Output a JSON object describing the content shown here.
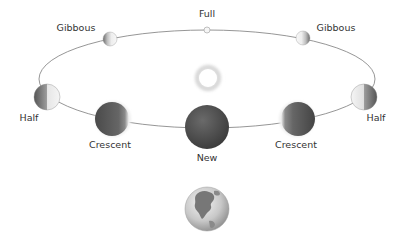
{
  "diagram": {
    "type": "moon-phases",
    "orbit": {
      "cx": 207,
      "cy": 79,
      "rx": 168,
      "ry": 49,
      "color": "#8a8a8a"
    },
    "sun": {
      "cx": 208,
      "cy": 78,
      "r": 12
    },
    "earth": {
      "cx": 207,
      "cy": 209,
      "r": 22
    },
    "phases": [
      {
        "id": "full",
        "label": "Full",
        "cx": 207,
        "cy": 30,
        "r": 3,
        "label_x": 207,
        "label_y": 17,
        "anchor": "middle"
      },
      {
        "id": "gibbous-left",
        "label": "Gibbous",
        "cx": 110,
        "cy": 39,
        "r": 7,
        "label_x": 76,
        "label_y": 31,
        "anchor": "middle"
      },
      {
        "id": "gibbous-right",
        "label": "Gibbous",
        "cx": 303,
        "cy": 38,
        "r": 7,
        "label_x": 336,
        "label_y": 31,
        "anchor": "middle"
      },
      {
        "id": "half-left",
        "label": "Half",
        "cx": 47,
        "cy": 97,
        "r": 13,
        "label_x": 29,
        "label_y": 120,
        "anchor": "middle"
      },
      {
        "id": "half-right",
        "label": "Half",
        "cx": 364,
        "cy": 97,
        "r": 13,
        "label_x": 376,
        "label_y": 120,
        "anchor": "middle"
      },
      {
        "id": "crescent-left",
        "label": "Crescent",
        "cx": 112,
        "cy": 119,
        "r": 17,
        "label_x": 110,
        "label_y": 148,
        "anchor": "middle"
      },
      {
        "id": "crescent-right",
        "label": "Crescent",
        "cx": 298,
        "cy": 119,
        "r": 17,
        "label_x": 296,
        "label_y": 148,
        "anchor": "middle"
      },
      {
        "id": "new",
        "label": "New",
        "cx": 207,
        "cy": 127,
        "r": 22,
        "label_x": 207,
        "label_y": 160,
        "anchor": "middle"
      }
    ],
    "labels": {
      "full": "Full",
      "gibbous_left": "Gibbous",
      "gibbous_right": "Gibbous",
      "half_left": "Half",
      "half_right": "Half",
      "crescent_left": "Crescent",
      "crescent_right": "Crescent",
      "new": "New"
    }
  }
}
